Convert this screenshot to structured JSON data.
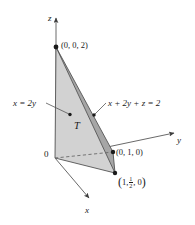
{
  "figure": {
    "background_color": "#ffffff",
    "line_color": "#4a4a4a",
    "text_color": "#1a1a1a",
    "front_face_color": "#d2d2d2",
    "slant_face_color": "#a6a6a6",
    "base_face_color": "#e0e0e0"
  },
  "axes": {
    "z": {
      "label": "z",
      "arrow": "up"
    },
    "y": {
      "label": "y",
      "arrow": "right"
    },
    "x": {
      "label": "x",
      "arrow": "down-right"
    },
    "origin": {
      "label": "0"
    }
  },
  "points": [
    {
      "id": "apex",
      "label": "(0, 0, 2)",
      "coords": [
        0,
        0,
        2
      ]
    },
    {
      "id": "y-vertex",
      "label": "(0, 1, 0)",
      "coords": [
        0,
        1,
        0
      ]
    },
    {
      "id": "x-vertex",
      "label_open": "(",
      "label_x": "1,",
      "frac_num": "1",
      "frac_den": "2",
      "label_z": ", 0",
      "label_close": ")",
      "coords": [
        1,
        0.5,
        0
      ]
    }
  ],
  "annotations": {
    "plane_left": {
      "lhs": "x",
      "eq": "=",
      "rhs": "2y",
      "full": "x = 2y"
    },
    "plane_right": {
      "full": "x + 2y + z = 2"
    },
    "region": {
      "label": "T"
    }
  },
  "geometry": {
    "origin_px": [
      55,
      158
    ],
    "apex_px": [
      56,
      47
    ],
    "y_vertex_px": [
      113,
      152
    ],
    "x_vertex_px": [
      115,
      173
    ],
    "z_arrow_tip_px": [
      56,
      14
    ],
    "y_arrow_tip_px": [
      178,
      132
    ],
    "x_arrow_tip_px": [
      92,
      201
    ]
  }
}
